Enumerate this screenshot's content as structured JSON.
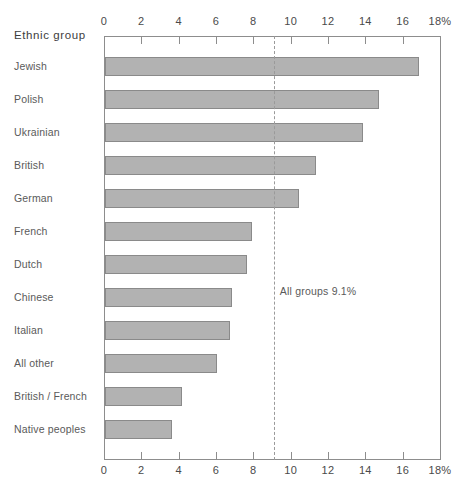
{
  "chart_data": {
    "type": "bar",
    "orientation": "horizontal",
    "title": "",
    "xlabel": "",
    "ylabel": "Ethnic group",
    "xlim": [
      0,
      18
    ],
    "xtick_labels": [
      "0",
      "2",
      "4",
      "6",
      "8",
      "10",
      "12",
      "14",
      "16",
      "18%"
    ],
    "xticks": [
      0,
      2,
      4,
      6,
      8,
      10,
      12,
      14,
      16,
      18
    ],
    "grid": false,
    "legend": "none",
    "axis_unit": "%",
    "categories": [
      "Jewish",
      "Polish",
      "Ukrainian",
      "British",
      "German",
      "French",
      "Dutch",
      "Chinese",
      "Italian",
      "All other",
      "British / French",
      "Native peoples"
    ],
    "values": [
      16.8,
      14.7,
      13.8,
      11.3,
      10.4,
      7.9,
      7.6,
      6.8,
      6.7,
      6.0,
      4.1,
      3.6
    ],
    "annotations": [
      {
        "text": "All groups 9.1%",
        "value": 9.1,
        "type": "reference-line",
        "style": "dashed"
      }
    ],
    "reference_line_value": 9.1,
    "colors": {
      "bar_fill": "#b2b2b2",
      "bar_stroke": "#8a8a8a",
      "axis": "#8d8d8d",
      "text": "#4a4a4a",
      "reference_line": "#9a9a9a"
    }
  }
}
